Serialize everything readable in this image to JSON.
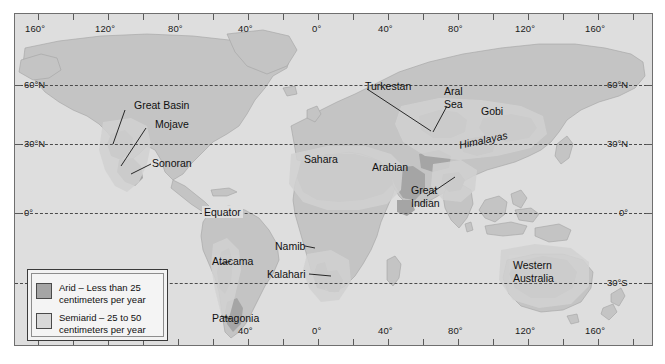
{
  "map": {
    "title": "World arid and semiarid regions",
    "projection_note": "cylindrical world map",
    "ocean_color": "#dedede",
    "arid_color": "#a9a9a9",
    "semiarid_color": "#c9c9c9",
    "land_outline_color": "#8a8a8a"
  },
  "axes": {
    "longitude_top": [
      "160°",
      "120°",
      "80°",
      "40°",
      "0°",
      "40°",
      "80°",
      "120°",
      "160°"
    ],
    "longitude_bottom": [
      "40°",
      "0°",
      "40°",
      "80°",
      "120°",
      "160°"
    ],
    "latitude_left": [
      "60°N",
      "30°N",
      "0°"
    ],
    "latitude_right": [
      "60°N",
      "30°N",
      "0°",
      "30°S"
    ],
    "equator_label": "Equator"
  },
  "legend": {
    "items": [
      {
        "swatch": "arid",
        "color": "#a9a9a9",
        "line1": "Arid – Less than 25",
        "line2": "centimeters per year"
      },
      {
        "swatch": "semiarid",
        "color": "#d3d3d3",
        "line1": "Semiarid – 25 to 50",
        "line2": "centimeters per year"
      }
    ]
  },
  "places": [
    {
      "name": "Great Basin",
      "line1": "Great Basin",
      "line2": ""
    },
    {
      "name": "Mojave",
      "line1": "Mojave",
      "line2": ""
    },
    {
      "name": "Sonoran",
      "line1": "Sonoran",
      "line2": ""
    },
    {
      "name": "Atacama",
      "line1": "Atacama",
      "line2": ""
    },
    {
      "name": "Patagonia",
      "line1": "Patagonia",
      "line2": ""
    },
    {
      "name": "Sahara",
      "line1": "Sahara",
      "line2": ""
    },
    {
      "name": "Namib",
      "line1": "Namib",
      "line2": ""
    },
    {
      "name": "Kalahari",
      "line1": "Kalahari",
      "line2": ""
    },
    {
      "name": "Arabian",
      "line1": "Arabian",
      "line2": ""
    },
    {
      "name": "Turkestan",
      "line1": "Turkestan",
      "line2": ""
    },
    {
      "name": "Aral Sea",
      "line1": "Aral",
      "line2": "Sea"
    },
    {
      "name": "Gobi",
      "line1": "Gobi",
      "line2": ""
    },
    {
      "name": "Himalayas",
      "line1": "Himalayas",
      "line2": ""
    },
    {
      "name": "Great Indian",
      "line1": "Great",
      "line2": "Indian"
    },
    {
      "name": "Western Australia",
      "line1": "Western",
      "line2": "Australia"
    }
  ]
}
